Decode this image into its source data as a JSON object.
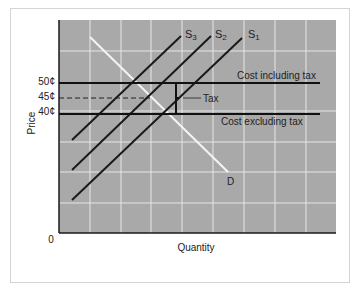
{
  "diagram": {
    "y_axis_label": "Price",
    "x_axis_label": "Quantity",
    "origin_label": "0",
    "price_ticks": [
      {
        "label": "50¢",
        "value": 50
      },
      {
        "label": "45¢",
        "value": 45
      },
      {
        "label": "40¢",
        "value": 40
      }
    ],
    "supply_curves": [
      {
        "label": "S3"
      },
      {
        "label": "S2"
      },
      {
        "label": "S1"
      }
    ],
    "demand_curve": {
      "label": "D"
    },
    "cost_lines": {
      "including_tax": "Cost including tax",
      "excluding_tax": "Cost excluding tax"
    },
    "tax_label": "Tax",
    "colors": {
      "plot_background": "#a9a9a9",
      "grid": "#e8e8e8",
      "supply": "#1a1a1a",
      "demand": "#f4f4f4",
      "cost_lines": "#111111"
    }
  }
}
